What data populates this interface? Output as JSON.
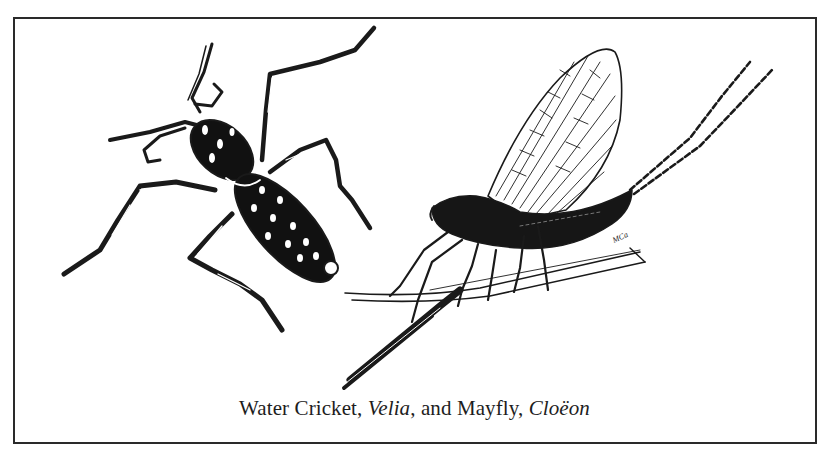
{
  "figure": {
    "caption": {
      "part1": "Water Cricket, ",
      "italic1": "Velia",
      "part2": ", and Mayfly, ",
      "italic2": "Cloëon"
    },
    "subjects": [
      {
        "common_name": "Water Cricket",
        "genus": "Velia",
        "position": "left"
      },
      {
        "common_name": "Mayfly",
        "genus": "Cloëon",
        "position": "right"
      }
    ],
    "signature": "MCa",
    "colors": {
      "ink": "#1a1a1a",
      "paper": "#ffffff",
      "frame": "#2a2a2a"
    }
  }
}
